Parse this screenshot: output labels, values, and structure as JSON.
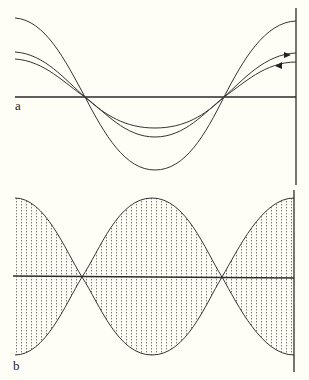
{
  "panels": [
    {
      "label": "a",
      "description": "Three sinusoidal curves sharing nodes on a horizontal axis, with a vertical boundary on the right; arrows indicate forward and reflected waves"
    },
    {
      "label": "b",
      "description": "Standing wave envelope with dotted vertical hatching between upper and lower envelopes, nodes on the horizontal axis"
    }
  ],
  "colors": {
    "background": "#fffef6",
    "line": "#2a2a2a",
    "hatch": "#666666"
  }
}
